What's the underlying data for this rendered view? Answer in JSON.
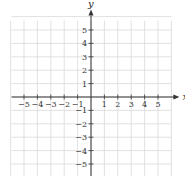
{
  "chart_data": {
    "type": "scatter",
    "title": "",
    "xlabel": "x",
    "ylabel": "y",
    "xlim": [
      -6,
      6
    ],
    "ylim": [
      -6,
      6
    ],
    "grid": true,
    "x_ticks": [
      -5,
      -4,
      -3,
      -2,
      -1,
      1,
      2,
      3,
      4,
      5
    ],
    "y_ticks": [
      -5,
      -4,
      -3,
      -2,
      -1,
      1,
      2,
      3,
      4,
      5
    ],
    "x_tick_labels": [
      "−5",
      "−4",
      "−3",
      "−2",
      "−1",
      "1",
      "2",
      "3",
      "4",
      "5"
    ],
    "y_tick_labels": [
      "5",
      "4",
      "3",
      "2",
      "1",
      "−1",
      "−2",
      "−3",
      "−4",
      "−5"
    ],
    "series": [],
    "colors": {
      "grid": "#d9d9d9",
      "axis": "#333333"
    }
  }
}
